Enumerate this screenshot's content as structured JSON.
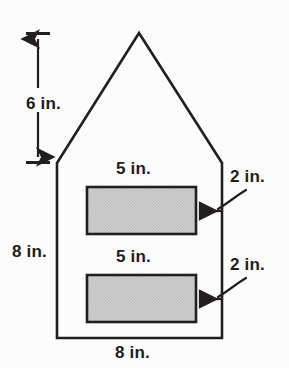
{
  "figure": {
    "background_color": "#fcfcfc",
    "stroke_color": "#231f20",
    "shaded_fill_color": "#c8c8c8",
    "labels": {
      "roof_height": "6 in.",
      "wall_height": "8 in.",
      "base_width": "8 in.",
      "window_top_width": "5 in.",
      "window_top_height": "2 in.",
      "window_bottom_width": "5 in.",
      "window_bottom_height": "2 in."
    },
    "shapes": {
      "house_outline": {
        "name": "house-pentagon",
        "points": "57,163 139,33 222,163 222,338 57,338",
        "filled": false
      },
      "window_top": {
        "name": "upper-shaded-rectangle",
        "x": 87,
        "y": 187,
        "width": 109,
        "height": 47
      },
      "window_bottom": {
        "name": "lower-shaded-rectangle",
        "x": 87,
        "y": 275,
        "width": 109,
        "height": 47
      }
    },
    "dimension_arrows": {
      "roof_height_arrow": {
        "name": "vertical-double-arrow",
        "x": 38,
        "y_top": 33,
        "y_bottom": 163,
        "tick_half_width": 12
      },
      "window_top_pointer": {
        "name": "curved-arrow-to-upper-rectangle",
        "tip_x": 198,
        "tip_y": 211
      },
      "window_bottom_pointer": {
        "name": "curved-arrow-to-lower-rectangle",
        "tip_x": 198,
        "tip_y": 299
      }
    }
  }
}
